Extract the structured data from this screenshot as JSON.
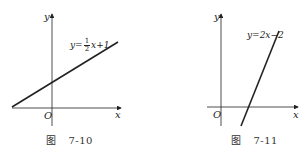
{
  "figures": [
    {
      "id": "7-10",
      "caption_prefix": "图",
      "caption_number": "7-10",
      "axis_x_label": "x",
      "axis_y_label": "y",
      "origin_label": "O",
      "equation": "y=½x+1",
      "equation_parts": {
        "lhs": "y=",
        "num": "1",
        "den": "2",
        "rhs": "x+1"
      }
    },
    {
      "id": "7-11",
      "caption_prefix": "图",
      "caption_number": "7-11",
      "axis_x_label": "x",
      "axis_y_label": "y",
      "origin_label": "O",
      "equation": "y=2x−2"
    }
  ],
  "colors": {
    "ink": "#222222",
    "background": "#ffffff"
  }
}
